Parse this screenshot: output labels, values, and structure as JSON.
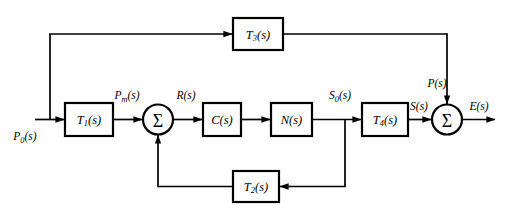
{
  "diagram": {
    "type": "signal-flow-block-diagram",
    "background_color": "#ffffff",
    "line_color": "#000000",
    "blocks": [
      {
        "id": "T1",
        "label_main": "T",
        "label_sub": "1",
        "label_tail": "(s)",
        "x": 65,
        "y": 103,
        "w": 48,
        "h": 33
      },
      {
        "id": "C",
        "label_main": "C",
        "label_sub": "",
        "label_tail": "(s)",
        "x": 203,
        "y": 103,
        "w": 38,
        "h": 33
      },
      {
        "id": "N",
        "label_main": "N",
        "label_sub": "",
        "label_tail": "(s)",
        "x": 271,
        "y": 103,
        "w": 41,
        "h": 33
      },
      {
        "id": "T4",
        "label_main": "T",
        "label_sub": "4",
        "label_tail": "(s)",
        "x": 362,
        "y": 103,
        "w": 46,
        "h": 33
      },
      {
        "id": "T3",
        "label_main": "T",
        "label_sub": "3",
        "label_tail": "(s)",
        "x": 233,
        "y": 18,
        "w": 50,
        "h": 32
      },
      {
        "id": "T2",
        "label_main": "T",
        "label_sub": "2",
        "label_tail": "(s)",
        "x": 233,
        "y": 171,
        "w": 46,
        "h": 31
      }
    ],
    "summing_junctions": [
      {
        "id": "sum1",
        "symbol": "Σ",
        "cx": 158,
        "cy": 119,
        "r": 15
      },
      {
        "id": "sum2",
        "symbol": "Σ",
        "cx": 447,
        "cy": 120,
        "r": 15
      }
    ],
    "signals": [
      {
        "id": "P0",
        "main": "P",
        "sub": "0",
        "tail": "(s)",
        "x": 21,
        "y": 137
      },
      {
        "id": "Pm",
        "main": "P",
        "sub": "m",
        "tail": "(s)",
        "x": 130,
        "y": 97
      },
      {
        "id": "R",
        "main": "R",
        "sub": "",
        "tail": "(s)",
        "x": 185,
        "y": 97
      },
      {
        "id": "S0",
        "main": "S",
        "sub": "0",
        "tail": "(s)",
        "x": 338,
        "y": 97
      },
      {
        "id": "S",
        "main": "S",
        "sub": "",
        "tail": "(s)",
        "x": 421,
        "y": 108
      },
      {
        "id": "P",
        "main": "P",
        "sub": "",
        "tail": "(s)",
        "x": 436,
        "y": 85
      },
      {
        "id": "E",
        "main": "E",
        "sub": "",
        "tail": "(s)",
        "x": 478,
        "y": 108
      }
    ],
    "paths": {
      "input_to_sum": "P0 input enters T1 then first summing junction",
      "forward": "sum1 to C(s) to N(s) to S0 node to T4(s) to sum2 to E(s) output",
      "feedforward_top": "P0 node branches up to T3(s) then right and down into sum2",
      "feedback_bottom": "S0 node branches down, left through T2(s), then up into sum1"
    }
  }
}
